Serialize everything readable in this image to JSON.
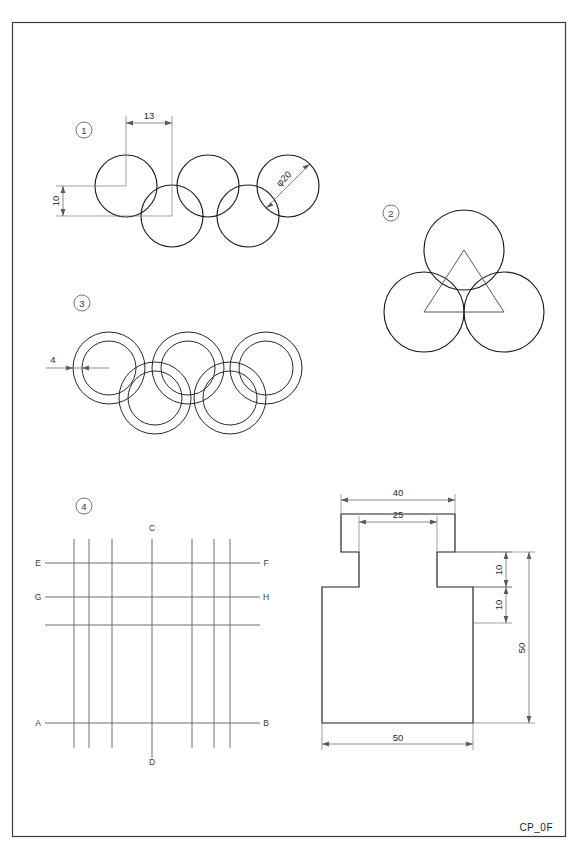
{
  "sheet": {
    "footer_label": "CP_0F",
    "border_color": "#3a3a3a",
    "line_color": "#1c1c1c",
    "dim_color": "#5a5a5a"
  },
  "figures": [
    {
      "id": "fig1",
      "marker": "1",
      "title": "five-circles-olympic",
      "dimensions": [
        {
          "name": "horizontal-spacing",
          "value": "13"
        },
        {
          "name": "vertical-offset",
          "value": "10"
        },
        {
          "name": "circle-diameter",
          "value": "φ20"
        }
      ],
      "circles": [
        {
          "cx": 126,
          "cy": 186,
          "r": 31
        },
        {
          "cx": 172,
          "cy": 216,
          "r": 31
        },
        {
          "cx": 208,
          "cy": 186,
          "r": 31
        },
        {
          "cx": 248,
          "cy": 216,
          "r": 31
        },
        {
          "cx": 288,
          "cy": 186,
          "r": 31
        }
      ]
    },
    {
      "id": "fig2",
      "marker": "2",
      "title": "three-circles-triangle",
      "circles": [
        {
          "cx": 464,
          "cy": 250,
          "r": 40
        },
        {
          "cx": 424,
          "cy": 312,
          "r": 40
        },
        {
          "cx": 504,
          "cy": 312,
          "r": 40
        }
      ],
      "triangle": [
        {
          "x": 464,
          "y": 250
        },
        {
          "x": 424,
          "y": 312
        },
        {
          "x": 504,
          "y": 312
        }
      ]
    },
    {
      "id": "fig3",
      "marker": "3",
      "title": "five-rings-annular",
      "dimensions": [
        {
          "name": "ring-thickness",
          "value": "4"
        }
      ],
      "rings": [
        {
          "cx": 109,
          "cy": 368,
          "outer": 36,
          "inner": 27
        },
        {
          "cx": 155,
          "cy": 398,
          "outer": 36,
          "inner": 27
        },
        {
          "cx": 188,
          "cy": 368,
          "outer": 36,
          "inner": 27
        },
        {
          "cx": 230,
          "cy": 398,
          "outer": 36,
          "inner": 27
        },
        {
          "cx": 266,
          "cy": 368,
          "outer": 36,
          "inner": 27
        }
      ]
    },
    {
      "id": "fig4",
      "marker": "4",
      "title": "labelled-grid",
      "point_labels": [
        {
          "name": "label-C",
          "text": "C",
          "x": 152,
          "y": 531
        },
        {
          "name": "label-D",
          "text": "D",
          "x": 152,
          "y": 765
        },
        {
          "name": "label-E",
          "text": "E",
          "x": 38,
          "y": 566
        },
        {
          "name": "label-F",
          "text": "F",
          "x": 266,
          "y": 566
        },
        {
          "name": "label-G",
          "text": "G",
          "x": 38,
          "y": 600
        },
        {
          "name": "label-H",
          "text": "H",
          "x": 266,
          "y": 600
        },
        {
          "name": "label-A",
          "text": "A",
          "x": 38,
          "y": 726
        },
        {
          "name": "label-B",
          "text": "B",
          "x": 266,
          "y": 726
        }
      ],
      "vertical_lines": [
        {
          "x": 74,
          "y1": 539,
          "y2": 748
        },
        {
          "x": 89,
          "y1": 539,
          "y2": 748
        },
        {
          "x": 112,
          "y1": 539,
          "y2": 748
        },
        {
          "x": 152,
          "y1": 539,
          "y2": 758
        },
        {
          "x": 192,
          "y1": 539,
          "y2": 748
        },
        {
          "x": 214,
          "y1": 539,
          "y2": 748
        },
        {
          "x": 230,
          "y1": 539,
          "y2": 748
        }
      ],
      "horizontal_lines": [
        {
          "y": 563,
          "x1": 45,
          "x2": 260
        },
        {
          "y": 597,
          "x1": 45,
          "x2": 260
        },
        {
          "y": 625,
          "x1": 45,
          "x2": 260
        },
        {
          "y": 723,
          "x1": 45,
          "x2": 260
        }
      ]
    },
    {
      "id": "fig5",
      "title": "stepped-t-part",
      "dimensions": [
        {
          "name": "top-width",
          "value": "40"
        },
        {
          "name": "neck-width",
          "value": "25"
        },
        {
          "name": "upper-step-height",
          "value": "10"
        },
        {
          "name": "lower-step-height",
          "value": "10"
        },
        {
          "name": "overall-height",
          "value": "50"
        },
        {
          "name": "base-width",
          "value": "50"
        }
      ],
      "profile": "M 341,514 L 455,514 L 455,552 L 437,552 L 437,587 L 473,587 L 473,723 L 322,723 L 322,587 L 359,587 L 359,552 L 341,552 Z"
    }
  ]
}
